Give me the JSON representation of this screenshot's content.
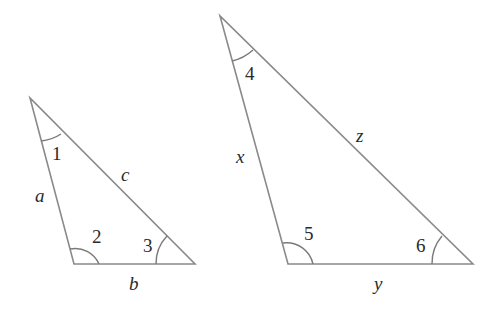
{
  "figure": {
    "triangle_small": {
      "sides": {
        "left": "a",
        "hypotenuse": "c",
        "base": "b"
      },
      "angles": {
        "top": "1",
        "bottom_left": "2",
        "bottom_right": "3"
      }
    },
    "triangle_large": {
      "sides": {
        "left": "x",
        "hypotenuse": "z",
        "base": "y"
      },
      "angles": {
        "top": "4",
        "bottom_left": "5",
        "bottom_right": "6"
      }
    },
    "colors": {
      "line": "#8a8a8a",
      "text": "#2a2a2a",
      "background": "#ffffff"
    }
  }
}
